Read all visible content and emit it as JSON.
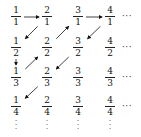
{
  "diagram": {
    "grid": [
      [
        {
          "num": "1",
          "den": "1"
        },
        {
          "num": "2",
          "den": "1"
        },
        {
          "num": "3",
          "den": "1"
        },
        {
          "num": "4",
          "den": "1"
        }
      ],
      [
        {
          "num": "1",
          "den": "2"
        },
        {
          "num": "2",
          "den": "2"
        },
        {
          "num": "3",
          "den": "2"
        },
        {
          "num": "4",
          "den": "2"
        }
      ],
      [
        {
          "num": "1",
          "den": "3"
        },
        {
          "num": "2",
          "den": "3"
        },
        {
          "num": "3",
          "den": "3"
        },
        {
          "num": "4",
          "den": "3"
        }
      ],
      [
        {
          "num": "1",
          "den": "4"
        },
        {
          "num": "2",
          "den": "4"
        },
        {
          "num": "3",
          "den": "4"
        },
        {
          "num": "4",
          "den": "4"
        }
      ]
    ],
    "row_ellipsis": "···",
    "column_ellipsis": "⋮",
    "arrows": [
      {
        "from": [
          0,
          0
        ],
        "to": [
          0,
          1
        ],
        "direction": "right"
      },
      {
        "from": [
          0,
          1
        ],
        "to": [
          1,
          0
        ],
        "direction": "down-left"
      },
      {
        "from": [
          1,
          0
        ],
        "to": [
          2,
          0
        ],
        "direction": "down"
      },
      {
        "from": [
          2,
          0
        ],
        "to": [
          1,
          1
        ],
        "direction": "up-right"
      },
      {
        "from": [
          1,
          1
        ],
        "to": [
          0,
          2
        ],
        "direction": "up-right"
      },
      {
        "from": [
          0,
          2
        ],
        "to": [
          0,
          3
        ],
        "direction": "right"
      },
      {
        "from": [
          0,
          3
        ],
        "to": [
          1,
          2
        ],
        "direction": "down-left"
      },
      {
        "from": [
          1,
          2
        ],
        "to": [
          2,
          1
        ],
        "direction": "down-left"
      },
      {
        "from": [
          2,
          1
        ],
        "to": [
          3,
          0
        ],
        "direction": "down-left"
      }
    ]
  }
}
